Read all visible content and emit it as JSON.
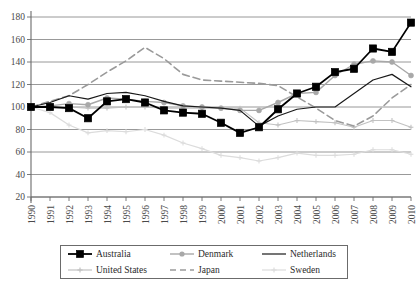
{
  "chart_data": {
    "type": "line",
    "title": "",
    "xlabel": "",
    "ylabel": "",
    "ylim": [
      20,
      180
    ],
    "ytick_step": 20,
    "yticks": [
      20,
      40,
      60,
      80,
      100,
      120,
      140,
      160,
      180
    ],
    "grid": true,
    "legend_position": "bottom",
    "x": [
      1990,
      1991,
      1992,
      1993,
      1994,
      1995,
      1996,
      1997,
      1998,
      1999,
      2000,
      2001,
      2002,
      2003,
      2004,
      2005,
      2006,
      2007,
      2008,
      2009,
      2010
    ],
    "categories": [
      "1990",
      "1991",
      "1992",
      "1993",
      "1994",
      "1995",
      "1996",
      "1997",
      "1998",
      "1999",
      "2000",
      "2001",
      "2002",
      "2003",
      "2004",
      "2005",
      "2006",
      "2007",
      "2008",
      "2009",
      "2010"
    ],
    "series": [
      {
        "name": "Australia",
        "color": "#000000",
        "marker": "square-filled",
        "dash": "solid",
        "width": 1.8,
        "values": [
          100,
          100,
          99,
          90,
          105,
          107,
          104,
          97,
          95,
          94,
          86,
          77,
          82,
          98,
          112,
          118,
          131,
          134,
          152,
          149,
          175
        ]
      },
      {
        "name": "Denmark",
        "color": "#a8a8a8",
        "marker": "circle-filled",
        "dash": "solid",
        "width": 1.4,
        "values": [
          100,
          101,
          103,
          102,
          108,
          107,
          105,
          104,
          101,
          100,
          99,
          97,
          97,
          104,
          112,
          113,
          128,
          138,
          141,
          140,
          128
        ]
      },
      {
        "name": "Netherlands",
        "color": "#1a1a1a",
        "marker": "none",
        "dash": "solid",
        "width": 1.2,
        "values": [
          100,
          104,
          110,
          107,
          112,
          113,
          110,
          105,
          101,
          100,
          99,
          97,
          83,
          92,
          98,
          100,
          100,
          112,
          124,
          129,
          118
        ]
      },
      {
        "name": "United States",
        "color": "#c2c2c2",
        "marker": "cross",
        "dash": "solid",
        "width": 1.2,
        "values": [
          100,
          100,
          100,
          99,
          99,
          100,
          100,
          99,
          99,
          99,
          99,
          99,
          86,
          84,
          88,
          87,
          86,
          82,
          88,
          88,
          82
        ]
      },
      {
        "name": "Japan",
        "color": "#9a9a9a",
        "marker": "none",
        "dash": "dashed",
        "width": 1.6,
        "values": [
          100,
          105,
          110,
          120,
          131,
          141,
          153,
          143,
          129,
          124,
          123,
          122,
          121,
          119,
          109,
          99,
          88,
          83,
          92,
          108,
          120
        ]
      },
      {
        "name": "Sweden",
        "color": "#dcdcdc",
        "marker": "cross",
        "dash": "solid",
        "width": 1.2,
        "values": [
          100,
          95,
          84,
          77,
          79,
          78,
          80,
          75,
          68,
          63,
          57,
          55,
          52,
          55,
          59,
          57,
          57,
          58,
          62,
          62,
          58
        ]
      }
    ]
  },
  "legend": {
    "items": [
      {
        "label": "Australia"
      },
      {
        "label": "Denmark"
      },
      {
        "label": "Netherlands"
      },
      {
        "label": "United States"
      },
      {
        "label": "Japan"
      },
      {
        "label": "Sweden"
      }
    ]
  }
}
